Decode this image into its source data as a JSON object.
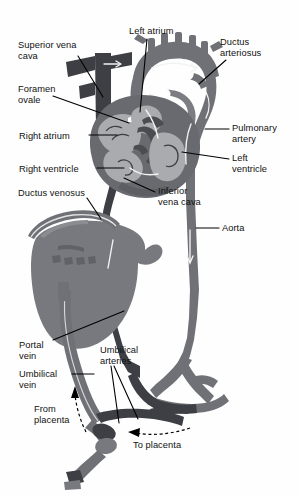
{
  "figure": {
    "type": "anatomical-diagram",
    "background_color": "#fefefe",
    "colors": {
      "vein_dark": "#3d3f44",
      "artery_mid": "#6f7176",
      "organ_gray": "#77797e",
      "heart_chamber_light": "#a9abae",
      "heart_wall": "#686a6f",
      "label_text": "#111111",
      "leader_line": "#000000"
    },
    "labels": [
      {
        "id": "superior-vena-cava",
        "text": "Superior vena\ncava",
        "x": 18,
        "y": 40,
        "align": "left"
      },
      {
        "id": "foramen-ovale",
        "text": "Foramen\novale",
        "x": 18,
        "y": 84,
        "align": "left"
      },
      {
        "id": "right-atrium",
        "text": "Right atrium",
        "x": 19,
        "y": 131,
        "align": "left"
      },
      {
        "id": "right-ventricle",
        "text": "Right ventricle",
        "x": 19,
        "y": 164,
        "align": "left"
      },
      {
        "id": "ductus-venosus",
        "text": "Ductus venosus",
        "x": 18,
        "y": 188,
        "align": "left"
      },
      {
        "id": "left-atrium",
        "text": "Left atrium",
        "x": 129,
        "y": 26,
        "align": "left"
      },
      {
        "id": "ductus-arteriosus",
        "text": "Ductus\narteriosus",
        "x": 220,
        "y": 37,
        "align": "left"
      },
      {
        "id": "pulmonary-artery",
        "text": "Pulmonary\nartery",
        "x": 232,
        "y": 123,
        "align": "left"
      },
      {
        "id": "left-ventricle",
        "text": "Left\nventricle",
        "x": 232,
        "y": 153,
        "align": "left"
      },
      {
        "id": "inferior-vena-cava",
        "text": "Inferior\nvena cava",
        "x": 158,
        "y": 186,
        "align": "left"
      },
      {
        "id": "aorta",
        "text": "Aorta",
        "x": 222,
        "y": 223,
        "align": "left"
      },
      {
        "id": "portal-vein",
        "text": "Portal\nvein",
        "x": 19,
        "y": 340,
        "align": "left"
      },
      {
        "id": "umbilical-vein",
        "text": "Umbilical\nvein",
        "x": 19,
        "y": 369,
        "align": "left"
      },
      {
        "id": "umbilical-arteries",
        "text": "Umbilical\narteries",
        "x": 100,
        "y": 345,
        "align": "left"
      },
      {
        "id": "from-placenta",
        "text": "From\nplacenta",
        "x": 34,
        "y": 404,
        "align": "left"
      },
      {
        "id": "to-placenta",
        "text": "To placenta",
        "x": 133,
        "y": 440,
        "align": "left"
      }
    ],
    "flow_arrows": [
      {
        "id": "from-placenta-arrow",
        "direction": "up",
        "style": "dashed"
      },
      {
        "id": "to-placenta-arrow",
        "direction": "left",
        "style": "dashed"
      }
    ]
  }
}
